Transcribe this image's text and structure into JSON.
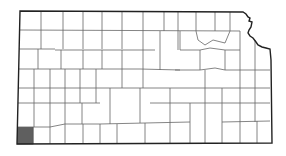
{
  "map": {
    "region": "Kansas",
    "subdivision": "counties",
    "highlighted_county": "Morton County",
    "colors": {
      "highlight": "#5f5f5f",
      "county_fill": "#ffffff",
      "border": "#555555",
      "background": "#ffffff"
    }
  }
}
